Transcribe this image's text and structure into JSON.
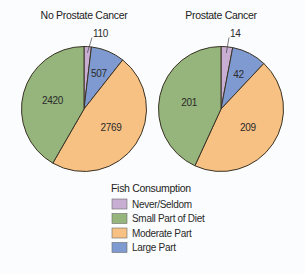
{
  "chart_data": [
    {
      "type": "pie",
      "title": "No Prostate Cancer",
      "categories": [
        "Never/Seldom",
        "Large Part",
        "Moderate Part",
        "Small Part of Diet"
      ],
      "values": [
        110,
        507,
        2769,
        2420
      ],
      "labels": [
        "110",
        "507",
        "2769",
        "2420"
      ]
    },
    {
      "type": "pie",
      "title": "Prostate Cancer",
      "categories": [
        "Never/Seldom",
        "Large Part",
        "Moderate Part",
        "Small Part of Diet"
      ],
      "values": [
        14,
        42,
        209,
        201
      ],
      "labels": [
        "14",
        "42",
        "209",
        "201"
      ]
    }
  ],
  "legend": {
    "title": "Fish Consumption",
    "placement": "bottom-center",
    "items": [
      {
        "label": "Never/Seldom",
        "color": "#c9aed3"
      },
      {
        "label": "Small Part of Diet",
        "color": "#95b57c"
      },
      {
        "label": "Moderate Part",
        "color": "#f7c184"
      },
      {
        "label": "Large Part",
        "color": "#7f9ad0"
      }
    ]
  },
  "colors": {
    "Never/Seldom": "#c9aed3",
    "Small Part of Diet": "#95b57c",
    "Moderate Part": "#f7c184",
    "Large Part": "#7f9ad0"
  }
}
